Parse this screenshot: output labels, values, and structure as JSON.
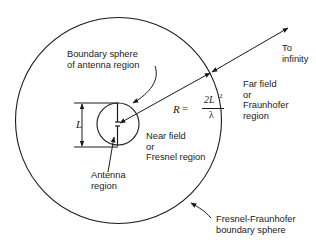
{
  "labels": {
    "boundary_sphere_antenna": "Boundary sphere\nof antenna region",
    "to_infinity": "To\ninfinity",
    "far_field": "Far field\nor\nFraunhofer\nregion",
    "near_field": "Near field\nor\nFresnel region",
    "antenna_region": "Antenna\nregion",
    "fresnel_fraunhofer_boundary": "Fresnel-Fraunhofer\nboundary sphere",
    "dimension_L": "L"
  },
  "formula": {
    "lhs": "R",
    "equals": "=",
    "numerator": "2L",
    "exponent": "2",
    "denominator": "λ"
  },
  "colors": {
    "stroke": "#1a1a1a",
    "background": "#ffffff"
  }
}
